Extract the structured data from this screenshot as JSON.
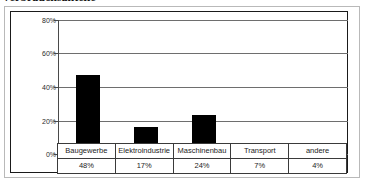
{
  "title": "Verbrauchsanteile",
  "chart_data": {
    "type": "bar",
    "title": "Verbrauchsanteile",
    "xlabel": "",
    "ylabel": "",
    "categories": [
      "Baugewerbe",
      "Elektroindustrie",
      "Maschinenbau",
      "Transport",
      "andere"
    ],
    "values": [
      48,
      17,
      24,
      7,
      4
    ],
    "value_labels": [
      "48%",
      "17%",
      "24%",
      "7%",
      "4%"
    ],
    "ylim": [
      0,
      80
    ],
    "ytick_labels": [
      "80%",
      "60%",
      "40%",
      "20%",
      "0%"
    ],
    "ytick_values": [
      80,
      60,
      40,
      20,
      0
    ],
    "grid": true,
    "legend": "none",
    "bar_color": "#000000",
    "series": [
      {
        "name": "Verbrauchsanteil",
        "values": [
          48,
          17,
          24,
          7,
          4
        ]
      }
    ]
  },
  "table": {
    "categories": [
      "Baugewerbe",
      "Elektroindustrie",
      "Maschinenbau",
      "Transport",
      "andere"
    ],
    "percents": [
      "48%",
      "17%",
      "24%",
      "7%",
      "4%"
    ]
  }
}
